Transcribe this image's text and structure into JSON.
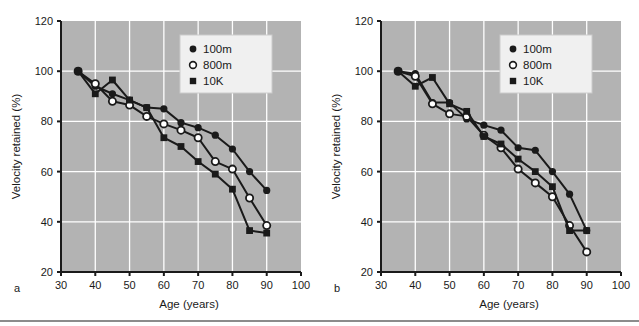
{
  "figure": {
    "background": "#ffffff",
    "plot_background": "#b3b3b3",
    "grid_color": "#ffffff",
    "axis_color": "#1a1a1a",
    "series_color": "#1a1a1a",
    "legend_background": "#f0f0f0"
  },
  "panels": [
    {
      "letter": "a",
      "chart_data": {
        "type": "line",
        "title": "",
        "xlabel": "Age (years)",
        "ylabel": "Velocity retained (%)",
        "xlim": [
          30,
          100
        ],
        "ylim": [
          20,
          120
        ],
        "xticks": [
          30,
          40,
          50,
          60,
          70,
          80,
          90,
          100
        ],
        "yticks": [
          20,
          40,
          60,
          80,
          100,
          120
        ],
        "grid": true,
        "legend_position": "top-right",
        "x": [
          35,
          40,
          45,
          50,
          55,
          60,
          65,
          70,
          75,
          80,
          85,
          90
        ],
        "series": [
          {
            "name": "100m",
            "marker": "filled-circle",
            "values": [
              100.0,
              94.0,
              91.0,
              88.5,
              85.5,
              85.0,
              79.5,
              77.5,
              74.5,
              69.0,
              60.0,
              52.5
            ]
          },
          {
            "name": "800m",
            "marker": "open-circle",
            "values": [
              100.0,
              95.0,
              88.0,
              86.5,
              82.0,
              79.0,
              76.5,
              73.5,
              64.0,
              61.0,
              49.5,
              38.5
            ]
          },
          {
            "name": "10K",
            "marker": "filled-square",
            "values": [
              100.0,
              91.0,
              96.5,
              88.5,
              85.5,
              73.5,
              70.0,
              64.0,
              59.0,
              53.0,
              36.5,
              35.5
            ]
          }
        ]
      }
    },
    {
      "letter": "b",
      "chart_data": {
        "type": "line",
        "title": "",
        "xlabel": "Age (years)",
        "ylabel": "Velocity retained (%)",
        "xlim": [
          30,
          100
        ],
        "ylim": [
          20,
          120
        ],
        "xticks": [
          30,
          40,
          50,
          60,
          70,
          80,
          90,
          100
        ],
        "yticks": [
          20,
          40,
          60,
          80,
          100,
          120
        ],
        "grid": true,
        "legend_position": "top-right",
        "x": [
          35,
          40,
          45,
          50,
          55,
          60,
          65,
          70,
          75,
          80,
          85,
          90
        ],
        "series": [
          {
            "name": "100m",
            "marker": "filled-circle",
            "values": [
              100.0,
              99.0,
              87.5,
              87.5,
              81.0,
              78.5,
              76.5,
              69.5,
              68.5,
              60.0,
              51.0,
              36.5
            ]
          },
          {
            "name": "800m",
            "marker": "open-circle",
            "values": [
              100.0,
              98.0,
              87.0,
              83.0,
              82.0,
              74.5,
              69.5,
              61.0,
              55.5,
              50.0,
              38.5,
              28.0
            ]
          },
          {
            "name": "10K",
            "marker": "filled-square",
            "values": [
              100.0,
              94.0,
              97.5,
              87.0,
              84.0,
              74.0,
              71.0,
              65.0,
              60.0,
              54.0,
              36.5,
              36.5
            ]
          }
        ]
      }
    }
  ],
  "legend": {
    "entries": [
      {
        "label": "100m",
        "marker": "filled-circle"
      },
      {
        "label": "800m",
        "marker": "open-circle"
      },
      {
        "label": "10K",
        "marker": "filled-square"
      }
    ]
  }
}
